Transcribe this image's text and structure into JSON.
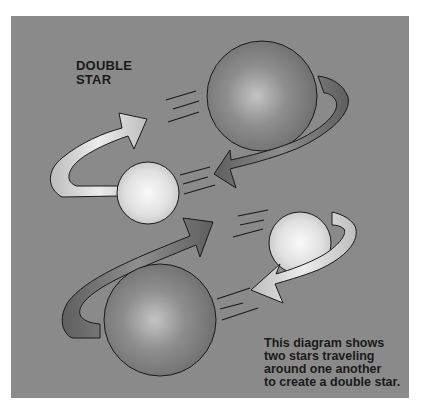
{
  "diagram": {
    "title_lines": [
      "DOUBLE",
      "STAR"
    ],
    "caption_lines": [
      "This diagram shows",
      "two stars traveling",
      "around one another",
      "to create a double star."
    ],
    "colors": {
      "background": "#8a8a8a",
      "large_star": "#777777",
      "small_star": "#e8e8e8",
      "arrow_light": "#d8d8d8",
      "arrow_dark": "#6e6e6e",
      "outline": "#1a1a1a"
    },
    "elements": [
      {
        "type": "large-star",
        "label": "top large star"
      },
      {
        "type": "small-star",
        "label": "left small star"
      },
      {
        "type": "small-star",
        "label": "right small star"
      },
      {
        "type": "large-star",
        "label": "bottom large star"
      },
      {
        "type": "orbit-arrow",
        "label": "upper orbit arrow pair"
      },
      {
        "type": "orbit-arrow",
        "label": "lower orbit arrow pair"
      }
    ]
  }
}
